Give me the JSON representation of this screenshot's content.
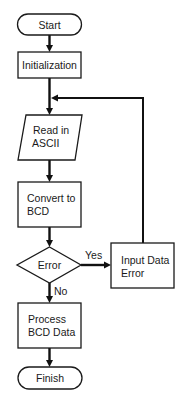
{
  "diagram": {
    "type": "flowchart",
    "nodes": {
      "start": {
        "label": "Start",
        "shape": "terminator"
      },
      "init": {
        "label": "Initialization",
        "shape": "process"
      },
      "read": {
        "line1": "Read in",
        "line2": "ASCII",
        "shape": "input-output"
      },
      "convert": {
        "line1": "Convert to",
        "line2": "BCD",
        "shape": "process"
      },
      "decision": {
        "label": "Error",
        "shape": "decision"
      },
      "error": {
        "line1": "Input Data",
        "line2": "Error",
        "shape": "process"
      },
      "process": {
        "line1": "Process",
        "line2": "BCD Data",
        "shape": "process"
      },
      "finish": {
        "label": "Finish",
        "shape": "terminator"
      }
    },
    "edges": [
      {
        "from": "start",
        "to": "init",
        "label": ""
      },
      {
        "from": "init",
        "to": "read",
        "label": ""
      },
      {
        "from": "read",
        "to": "convert",
        "label": ""
      },
      {
        "from": "convert",
        "to": "decision",
        "label": ""
      },
      {
        "from": "decision",
        "to": "error",
        "label": "Yes"
      },
      {
        "from": "decision",
        "to": "process",
        "label": "No"
      },
      {
        "from": "error",
        "to": "read",
        "label": ""
      },
      {
        "from": "process",
        "to": "finish",
        "label": ""
      }
    ],
    "edge_labels": {
      "yes": "Yes",
      "no": "No"
    },
    "colors": {
      "stroke": "#111111",
      "fill": "#ffffff",
      "text": "#1a1a1a"
    }
  }
}
